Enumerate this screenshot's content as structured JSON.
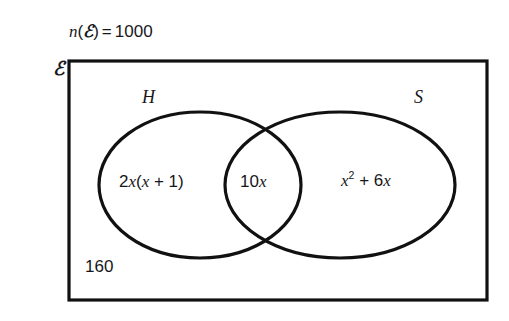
{
  "diagram": {
    "type": "venn-2-set",
    "universe": {
      "equation": {
        "function_name": "n",
        "open_paren": "(",
        "symbol": "ℰ",
        "close_paren": ")",
        "operator": "=",
        "value": "1000"
      },
      "corner_label": "ℰ",
      "total": 1000
    },
    "sets": [
      {
        "id": "H",
        "label": "H",
        "position": "left"
      },
      {
        "id": "S",
        "label": "S",
        "position": "right"
      }
    ],
    "regions": [
      {
        "id": "h-only",
        "name": "H only",
        "expression": "2x(x + 1)",
        "parts": [
          {
            "text": "2",
            "style": "num"
          },
          {
            "text": "x",
            "style": "var"
          },
          {
            "text": "(",
            "style": "num"
          },
          {
            "text": "x",
            "style": "var"
          },
          {
            "text": " + ",
            "style": "num"
          },
          {
            "text": "1)",
            "style": "num"
          }
        ]
      },
      {
        "id": "intersection",
        "name": "H and S",
        "expression": "10x",
        "parts": [
          {
            "text": "10",
            "style": "num"
          },
          {
            "text": "x",
            "style": "var"
          }
        ]
      },
      {
        "id": "s-only",
        "name": "S only",
        "expression": "x^2 + 6x",
        "parts": [
          {
            "text": "x",
            "style": "var"
          },
          {
            "text": "2",
            "style": "sup"
          },
          {
            "text": " + ",
            "style": "num"
          },
          {
            "text": "6",
            "style": "num"
          },
          {
            "text": "x",
            "style": "var"
          }
        ]
      },
      {
        "id": "outside",
        "name": "outside both sets",
        "expression": "160"
      }
    ],
    "colors": {
      "stroke": "#111111",
      "background": "#ffffff",
      "text": "#17171a"
    },
    "geometry": {
      "rectangle": {
        "x": 69,
        "y": 61,
        "width": 418,
        "height": 239
      },
      "ellipse_h": {
        "cx": 200,
        "cy": 185,
        "rx": 101,
        "ry": 73
      },
      "ellipse_s": {
        "cx": 340,
        "cy": 185,
        "rx": 115,
        "ry": 73
      }
    }
  }
}
